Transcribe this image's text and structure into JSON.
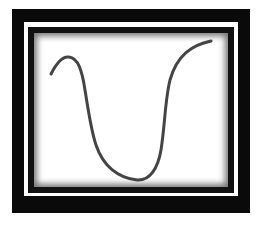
{
  "figure": {
    "shape": "u-shaped-curve",
    "colors": {
      "frame": "#0a0a0a",
      "gap": "#ffffff",
      "inner_border": "#111111",
      "background": "#ffffff",
      "stroke": "#444444"
    },
    "stroke_width": 3,
    "curve_points": [
      [
        51,
        74
      ],
      [
        68,
        57
      ],
      [
        85,
        90
      ],
      [
        95,
        140
      ],
      [
        137,
        180
      ],
      [
        162,
        155
      ],
      [
        170,
        80
      ],
      [
        211,
        41
      ]
    ]
  }
}
